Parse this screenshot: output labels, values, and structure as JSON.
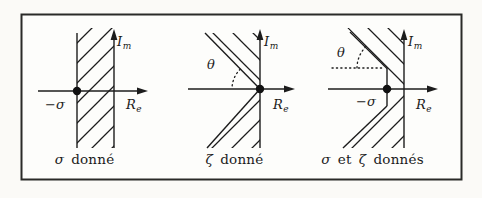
{
  "figure": {
    "panels": [
      {
        "id": "sigma-given",
        "axis_imag": {
          "main": "I",
          "sub": "m"
        },
        "axis_real": {
          "main": "R",
          "sub": "e"
        },
        "pole_label": "−σ",
        "caption": {
          "greek1": "σ",
          "mid": "donné",
          "greek2": "",
          "rest": ""
        }
      },
      {
        "id": "zeta-given",
        "axis_imag": {
          "main": "I",
          "sub": "m"
        },
        "axis_real": {
          "main": "R",
          "sub": "e"
        },
        "angle_label": "θ",
        "caption": {
          "greek1": "ζ",
          "mid": "donné",
          "greek2": "",
          "rest": ""
        }
      },
      {
        "id": "sigma-and-zeta-given",
        "axis_imag": {
          "main": "I",
          "sub": "m"
        },
        "axis_real": {
          "main": "R",
          "sub": "e"
        },
        "pole_label": "−σ",
        "angle_label": "θ",
        "caption": {
          "greek1": "σ",
          "mid": "et",
          "greek2": "ζ",
          "rest": "donnés"
        }
      }
    ],
    "colors": {
      "ink": "#1c1c1c",
      "paper": "#fbfaf7"
    }
  }
}
